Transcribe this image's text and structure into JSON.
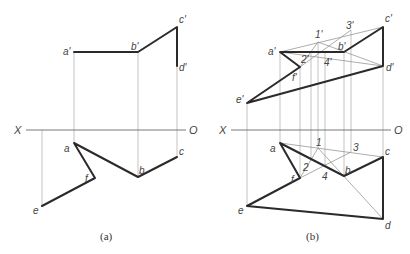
{
  "figure": {
    "panels": [
      {
        "id": "a",
        "caption": "(a)",
        "axis": {
          "left_label": "X",
          "right_label": "O"
        },
        "front_labels": {
          "a": "a'",
          "b": "b'",
          "c": "c'",
          "d": "d'"
        },
        "top_labels": {
          "a": "a",
          "b": "b",
          "c": "c",
          "e": "e",
          "f": "f"
        }
      },
      {
        "id": "b",
        "caption": "(b)",
        "axis": {
          "left_label": "X",
          "right_label": "O"
        },
        "front_labels": {
          "a": "a'",
          "b": "b'",
          "c": "c'",
          "d": "d'",
          "e": "e'",
          "f": "f'",
          "p1": "1'",
          "p2": "2'",
          "p3": "3'",
          "p4": "4'"
        },
        "top_labels": {
          "a": "a",
          "b": "b",
          "c": "c",
          "d": "d",
          "e": "e",
          "f": "f",
          "p1": "1",
          "p2": "2",
          "p3": "3",
          "p4": "4"
        }
      }
    ]
  }
}
